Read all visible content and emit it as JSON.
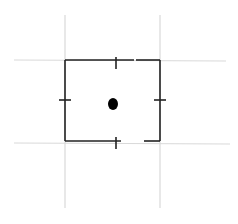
{
  "diagram": {
    "grid_lines": {
      "color": "#d9d9d9",
      "vertical_x": [
        65,
        160
      ],
      "horizontal_y": [
        60,
        143
      ]
    },
    "box": {
      "x1": 65,
      "y1": 60,
      "x2": 160,
      "y2": 141,
      "stroke": "#222222"
    },
    "ticks": [
      {
        "side": "top",
        "x": 116,
        "y": 60
      },
      {
        "side": "bottom",
        "x": 116,
        "y": 141
      },
      {
        "side": "left",
        "x": 65,
        "y": 100
      },
      {
        "side": "right",
        "x": 160,
        "y": 100
      }
    ],
    "gaps": [
      {
        "side": "top",
        "x1": 133,
        "x2": 136
      },
      {
        "side": "bottom",
        "x1": 121,
        "x2": 144
      }
    ],
    "center_dot": {
      "cx": 113,
      "cy": 104,
      "rx": 5,
      "ry": 6,
      "fill": "#000000"
    }
  }
}
